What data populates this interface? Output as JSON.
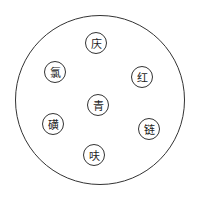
{
  "diagram": {
    "nodes": [
      {
        "label": "庆",
        "x": 96,
        "y": 43
      },
      {
        "label": "氯",
        "x": 55,
        "y": 72
      },
      {
        "label": "红",
        "x": 142,
        "y": 77
      },
      {
        "label": "青",
        "x": 98,
        "y": 105
      },
      {
        "label": "磺",
        "x": 53,
        "y": 124
      },
      {
        "label": "链",
        "x": 149,
        "y": 129
      },
      {
        "label": "呋",
        "x": 94,
        "y": 155
      }
    ]
  }
}
